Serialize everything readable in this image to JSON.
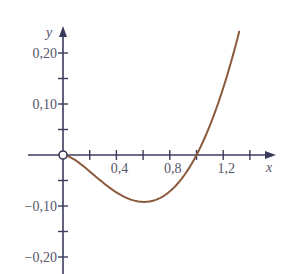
{
  "chart_data": {
    "type": "line",
    "title": "",
    "xlabel": "x",
    "ylabel": "y",
    "xlim": [
      -0.4,
      1.6
    ],
    "ylim": [
      -0.24,
      0.24
    ],
    "grid": false,
    "legend": null,
    "x_ticks": [
      0.2,
      0.4,
      0.6,
      0.8,
      1.0,
      1.2,
      1.4
    ],
    "x_tick_labels": [
      {
        "value": 0.4,
        "label": "0,4"
      },
      {
        "value": 0.8,
        "label": "0,8"
      },
      {
        "value": 1.2,
        "label": "1,2"
      }
    ],
    "y_ticks": [
      0.2,
      0.15,
      0.1,
      0.05,
      -0.05,
      -0.1,
      -0.15,
      -0.2
    ],
    "y_tick_labels": [
      {
        "value": 0.2,
        "label": "0,20"
      },
      {
        "value": 0.1,
        "label": "0,10"
      },
      {
        "value": -0.1,
        "label": "−0,10"
      },
      {
        "value": -0.2,
        "label": "−0,20"
      }
    ],
    "series": [
      {
        "name": "f(x)",
        "color": "#8b5a3c",
        "x": [
          0.0,
          0.1,
          0.2,
          0.3,
          0.4,
          0.5,
          0.6,
          0.7,
          0.8,
          0.9,
          1.0,
          1.1,
          1.2,
          1.3
        ],
        "y": [
          0.0,
          -0.012,
          -0.032,
          -0.054,
          -0.073,
          -0.087,
          -0.092,
          -0.087,
          -0.071,
          -0.043,
          0.0,
          0.058,
          0.131,
          0.222
        ]
      }
    ],
    "annotations": [
      {
        "type": "open-circle",
        "x": 0,
        "y": 0
      }
    ]
  },
  "colors": {
    "axis": "#3b3b5c",
    "curve": "#8b5a3c",
    "label": "#55556a"
  }
}
